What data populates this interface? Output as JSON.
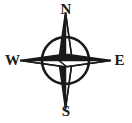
{
  "figure": {
    "name": "compass-rose",
    "type": "north-arrow-compass-rose",
    "background_color": "#ffffff",
    "ink_color": "#1a1a1a",
    "width": 132,
    "height": 123
  },
  "compass": {
    "center_x": 65.5,
    "center_y": 60.5,
    "circle_radius": 24,
    "circle_stroke_width": 2.6,
    "circle_fill": "none",
    "arrow_tip_length": 48,
    "arrow_half_width": 6,
    "dark_half_color": "#1a1a1a",
    "light_half_color": "#ffffff",
    "points": [
      {
        "id": "north",
        "label": "N",
        "bearing_degrees": 0,
        "label_x": 65.5,
        "label_y": 10
      },
      {
        "id": "east",
        "label": "E",
        "bearing_degrees": 90,
        "label_x": 119,
        "label_y": 60.5
      },
      {
        "id": "south",
        "label": "S",
        "bearing_degrees": 180,
        "label_x": 65.5,
        "label_y": 112
      },
      {
        "id": "west",
        "label": "W",
        "bearing_degrees": 270,
        "label_x": 13,
        "label_y": 60.5
      }
    ]
  },
  "labels": {
    "north": "N",
    "east": "E",
    "south": "S",
    "west": "W"
  }
}
